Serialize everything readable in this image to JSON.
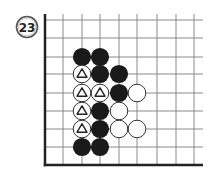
{
  "diagram": {
    "type": "go-board-fragment",
    "problem_number": "23",
    "colors": {
      "grid_line": "#8a8a8a",
      "edge_line": "#222222",
      "black_stone": "#1a1a1a",
      "white_stone_fill": "#ffffff",
      "white_stone_stroke": "#333333",
      "badge_stroke": "#555555",
      "badge_text": "#222222"
    },
    "grid": {
      "columns_x": [
        45,
        63,
        82,
        100,
        119,
        137,
        157,
        176,
        194
      ],
      "rows_y": [
        20,
        38,
        57,
        74,
        93,
        111,
        129,
        147,
        165
      ],
      "left_edge": true,
      "bottom_edge": true,
      "extend_right_to": 203,
      "extend_top_to": 14
    },
    "stones": [
      {
        "col": 2,
        "row": 2,
        "color": "black"
      },
      {
        "col": 3,
        "row": 2,
        "color": "black"
      },
      {
        "col": 2,
        "row": 3,
        "color": "white",
        "mark": "triangle"
      },
      {
        "col": 3,
        "row": 3,
        "color": "black"
      },
      {
        "col": 4,
        "row": 3,
        "color": "black"
      },
      {
        "col": 2,
        "row": 4,
        "color": "white",
        "mark": "triangle"
      },
      {
        "col": 3,
        "row": 4,
        "color": "white",
        "mark": "triangle"
      },
      {
        "col": 4,
        "row": 4,
        "color": "black"
      },
      {
        "col": 5,
        "row": 4,
        "color": "white"
      },
      {
        "col": 2,
        "row": 5,
        "color": "white",
        "mark": "triangle"
      },
      {
        "col": 3,
        "row": 5,
        "color": "black"
      },
      {
        "col": 4,
        "row": 5,
        "color": "white"
      },
      {
        "col": 2,
        "row": 6,
        "color": "white",
        "mark": "triangle"
      },
      {
        "col": 3,
        "row": 6,
        "color": "black"
      },
      {
        "col": 4,
        "row": 6,
        "color": "white"
      },
      {
        "col": 5,
        "row": 6,
        "color": "white"
      },
      {
        "col": 2,
        "row": 7,
        "color": "black"
      },
      {
        "col": 3,
        "row": 7,
        "color": "black"
      }
    ]
  }
}
